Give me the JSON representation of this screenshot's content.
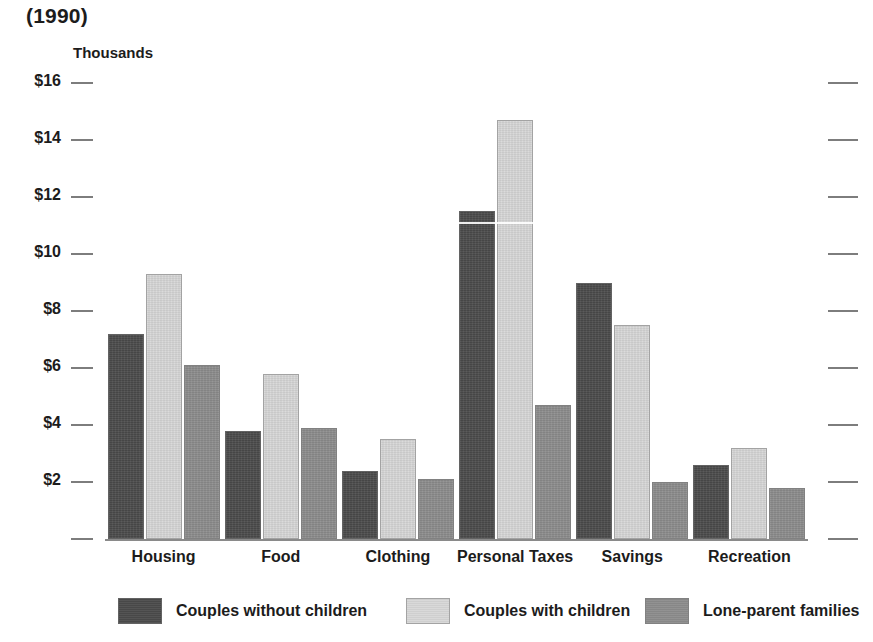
{
  "chart_data": {
    "type": "bar",
    "title": "(1990)",
    "xlabel": "",
    "ylabel": "Thousands",
    "ylim": [
      0,
      16
    ],
    "ytick_labels": [
      "$16",
      "$14",
      "$12",
      "$10",
      "$8",
      "$6",
      "$4",
      "$2",
      ""
    ],
    "ytick_values": [
      16,
      14,
      12,
      10,
      8,
      6,
      4,
      2,
      0
    ],
    "grid": false,
    "legend_position": "bottom",
    "categories": [
      "Housing",
      "Food",
      "Clothing",
      "Personal Taxes",
      "Savings",
      "Recreation"
    ],
    "series": [
      {
        "name": "Couples without children",
        "color": "#4b4b4b",
        "values": [
          7.2,
          3.8,
          2.4,
          11.5,
          9.0,
          2.6
        ]
      },
      {
        "name": "Couples with children",
        "color": "#d7d7d7",
        "values": [
          9.3,
          5.8,
          3.5,
          14.7,
          7.5,
          3.2
        ]
      },
      {
        "name": "Lone-parent families",
        "color": "#8c8c8c",
        "values": [
          6.1,
          3.9,
          2.1,
          4.7,
          2.0,
          1.8
        ]
      }
    ]
  },
  "colors": {
    "series_dark": "#4b4b4b",
    "series_light": "#d7d7d7",
    "series_mid": "#8c8c8c",
    "axis": "#7d7d7d",
    "text": "#1c1c1c"
  }
}
